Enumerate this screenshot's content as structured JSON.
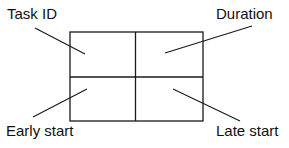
{
  "diagram": {
    "type": "activity-node-template",
    "labels": {
      "top_left": "Task ID",
      "top_right": "Duration",
      "bottom_left": "Early start",
      "bottom_right": "Late start"
    },
    "grid": {
      "rows": 2,
      "cols": 2
    },
    "colors": {
      "line": "#1a1a1a",
      "text": "#111111",
      "background": "#ffffff"
    }
  }
}
